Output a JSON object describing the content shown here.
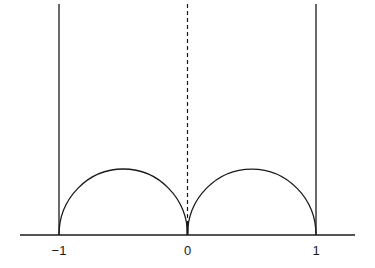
{
  "diagram": {
    "axis": {
      "tick_labels": [
        "−1",
        "0",
        "1"
      ],
      "tick_values": [
        -1,
        0,
        1
      ]
    },
    "vertical_lines": [
      {
        "x": -1,
        "style": "solid"
      },
      {
        "x": 0,
        "style": "dashed"
      },
      {
        "x": 1,
        "style": "solid"
      }
    ],
    "semicircles": [
      {
        "center": -0.5,
        "radius": 0.5
      },
      {
        "center": 0.5,
        "radius": 0.5
      }
    ],
    "colors": {
      "stroke": "#1a1a1a",
      "background": "#ffffff"
    }
  }
}
